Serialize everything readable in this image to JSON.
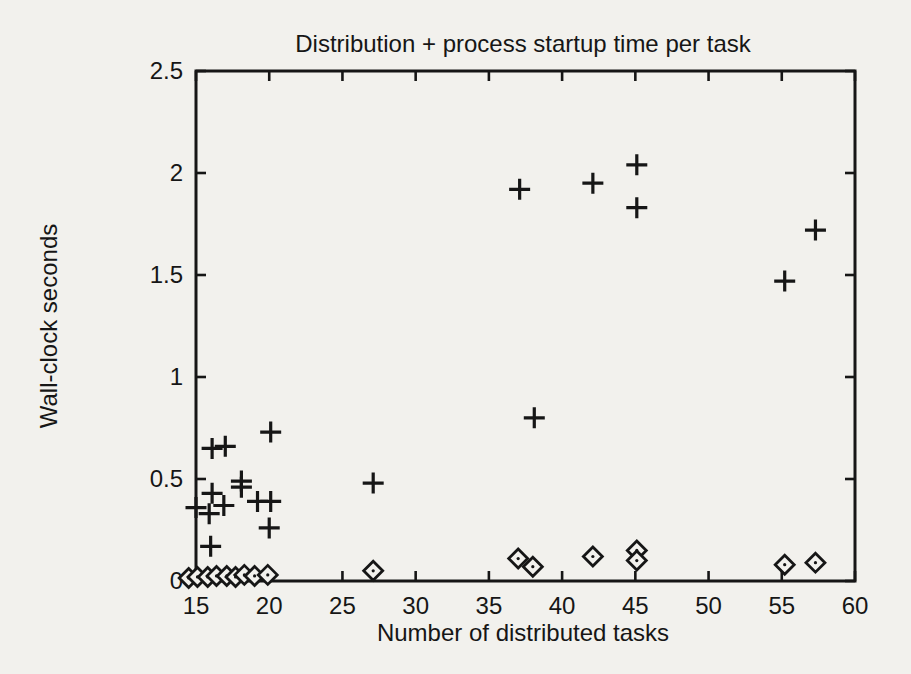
{
  "page": {
    "background_color": "#f2f1ed",
    "ink_color": "#161616"
  },
  "chart_data": {
    "type": "scatter",
    "title": "Distribution + process startup time per task",
    "xlabel": "Number of distributed tasks",
    "ylabel": "Wall-clock seconds",
    "xlim": [
      15,
      60
    ],
    "ylim": [
      0,
      2.5
    ],
    "x_ticks": [
      15,
      20,
      25,
      30,
      35,
      40,
      45,
      50,
      55,
      60
    ],
    "y_ticks": [
      0,
      0.5,
      1,
      1.5,
      2,
      2.5
    ],
    "x_tick_labels": [
      "15",
      "20",
      "25",
      "30",
      "35",
      "40",
      "45",
      "50",
      "55",
      "60"
    ],
    "y_tick_labels": [
      "0",
      "0.5",
      "1",
      "1.5",
      "2",
      "2.5"
    ],
    "grid": false,
    "legend": "none",
    "series": [
      {
        "name": "plus",
        "marker": "plus",
        "color": "#161616",
        "points": [
          [
            15.0,
            0.36
          ],
          [
            15.9,
            0.33
          ],
          [
            16.0,
            0.17
          ],
          [
            16.1,
            0.43
          ],
          [
            16.1,
            0.65
          ],
          [
            16.9,
            0.37
          ],
          [
            17.0,
            0.66
          ],
          [
            18.1,
            0.49
          ],
          [
            18.1,
            0.46
          ],
          [
            19.2,
            0.39
          ],
          [
            20.0,
            0.26
          ],
          [
            20.1,
            0.39
          ],
          [
            20.1,
            0.73
          ],
          [
            27.1,
            0.48
          ],
          [
            37.1,
            1.92
          ],
          [
            38.1,
            0.8
          ],
          [
            42.1,
            1.95
          ],
          [
            45.1,
            2.04
          ],
          [
            45.1,
            1.83
          ],
          [
            55.2,
            1.47
          ],
          [
            57.3,
            1.72
          ]
        ]
      },
      {
        "name": "diamond",
        "marker": "diamond",
        "color": "#161616",
        "points": [
          [
            14.5,
            0.015
          ],
          [
            15.1,
            0.02
          ],
          [
            15.8,
            0.02
          ],
          [
            16.4,
            0.025
          ],
          [
            17.1,
            0.025
          ],
          [
            17.7,
            0.02
          ],
          [
            18.3,
            0.03
          ],
          [
            19.0,
            0.025
          ],
          [
            19.9,
            0.03
          ],
          [
            27.1,
            0.05
          ],
          [
            37.0,
            0.11
          ],
          [
            38.0,
            0.07
          ],
          [
            42.1,
            0.12
          ],
          [
            45.1,
            0.15
          ],
          [
            45.1,
            0.1
          ],
          [
            55.2,
            0.08
          ],
          [
            57.3,
            0.09
          ]
        ]
      }
    ]
  }
}
